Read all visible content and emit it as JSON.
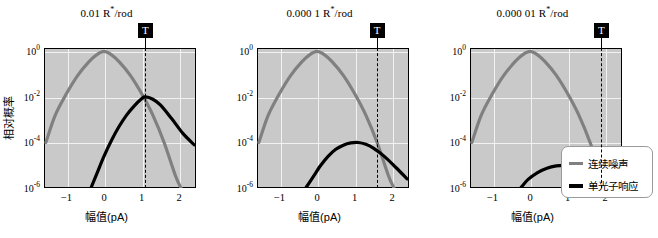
{
  "figure": {
    "y_axis_label": "相对概率",
    "x_axis_label": "幅值(pA)",
    "y_ticks": [
      {
        "mantissa": "10",
        "exp": "0",
        "value": 0
      },
      {
        "mantissa": "10",
        "exp": "-2",
        "value": -2
      },
      {
        "mantissa": "10",
        "exp": "-4",
        "value": -4
      },
      {
        "mantissa": "10",
        "exp": "-6",
        "value": -6
      }
    ],
    "x_ticks": [
      "-1",
      "0",
      "1",
      "2"
    ],
    "threshold_marker": "T",
    "colors": {
      "noise": "#808080",
      "photon": "#000000",
      "plot_background": "#c9c9c9",
      "gridline": "#f2f2f2",
      "axis": "#000000"
    }
  },
  "legend": {
    "position": "right",
    "entries": [
      {
        "label": "连续噪声",
        "color": "#808080"
      },
      {
        "label": "单光子响应",
        "color": "#000000"
      }
    ]
  },
  "chart_data": [
    {
      "type": "line",
      "title": "0.01 R*/rod",
      "title_prefix": "0.01 R",
      "title_suffix": "/rod",
      "xlabel": "幅值(pA)",
      "ylabel": "相对概率",
      "xlim": [
        -1.6,
        2.45
      ],
      "ylim": [
        -6,
        0.15
      ],
      "yscale": "log10",
      "grid": true,
      "threshold": {
        "label": "T",
        "x": 1.1
      },
      "series": [
        {
          "name": "连续噪声",
          "color": "#808080",
          "peak_x": 0.0,
          "peak_log10y": 0.0,
          "points": [
            [
              -1.55,
              -4.0
            ],
            [
              -1.3,
              -2.8
            ],
            [
              -1.0,
              -1.85
            ],
            [
              -0.7,
              -1.05
            ],
            [
              -0.4,
              -0.45
            ],
            [
              -0.2,
              -0.15
            ],
            [
              0.0,
              0.0
            ],
            [
              0.2,
              -0.15
            ],
            [
              0.4,
              -0.45
            ],
            [
              0.7,
              -1.05
            ],
            [
              1.0,
              -1.85
            ],
            [
              1.3,
              -2.8
            ],
            [
              1.6,
              -4.0
            ],
            [
              1.9,
              -5.45
            ],
            [
              2.05,
              -6.0
            ]
          ]
        },
        {
          "name": "单光子响应",
          "color": "#000000",
          "peak_x": 1.1,
          "peak_log10y": -2.0,
          "points": [
            [
              -0.35,
              -6.0
            ],
            [
              -0.2,
              -5.4
            ],
            [
              0.0,
              -4.6
            ],
            [
              0.2,
              -3.9
            ],
            [
              0.4,
              -3.3
            ],
            [
              0.6,
              -2.8
            ],
            [
              0.8,
              -2.4
            ],
            [
              1.0,
              -2.08
            ],
            [
              1.1,
              -2.0
            ],
            [
              1.3,
              -2.1
            ],
            [
              1.5,
              -2.35
            ],
            [
              1.8,
              -2.95
            ],
            [
              2.1,
              -3.6
            ],
            [
              2.4,
              -4.1
            ]
          ]
        }
      ]
    },
    {
      "type": "line",
      "title": "0.000 1 R*/rod",
      "title_prefix": "0.000 1 R",
      "title_suffix": "/rod",
      "xlabel": "幅值(pA)",
      "ylabel": "相对概率",
      "xlim": [
        -1.6,
        2.45
      ],
      "ylim": [
        -6,
        0.15
      ],
      "yscale": "log10",
      "grid": true,
      "threshold": {
        "label": "T",
        "x": 1.6
      },
      "series": [
        {
          "name": "连续噪声",
          "color": "#808080",
          "peak_x": 0.0,
          "peak_log10y": 0.0,
          "points": [
            [
              -1.55,
              -4.0
            ],
            [
              -1.3,
              -2.8
            ],
            [
              -1.0,
              -1.85
            ],
            [
              -0.7,
              -1.05
            ],
            [
              -0.4,
              -0.45
            ],
            [
              -0.2,
              -0.15
            ],
            [
              0.0,
              0.0
            ],
            [
              0.2,
              -0.15
            ],
            [
              0.4,
              -0.45
            ],
            [
              0.7,
              -1.05
            ],
            [
              1.0,
              -1.85
            ],
            [
              1.3,
              -2.8
            ],
            [
              1.6,
              -4.0
            ],
            [
              1.9,
              -5.45
            ],
            [
              2.05,
              -6.0
            ]
          ]
        },
        {
          "name": "单光子响应",
          "color": "#000000",
          "peak_x": 1.1,
          "peak_log10y": -4.0,
          "points": [
            [
              -0.3,
              -6.0
            ],
            [
              -0.1,
              -5.5
            ],
            [
              0.1,
              -5.0
            ],
            [
              0.3,
              -4.6
            ],
            [
              0.5,
              -4.3
            ],
            [
              0.7,
              -4.12
            ],
            [
              0.9,
              -4.02
            ],
            [
              1.1,
              -4.0
            ],
            [
              1.3,
              -4.08
            ],
            [
              1.5,
              -4.25
            ],
            [
              1.8,
              -4.62
            ],
            [
              2.1,
              -5.1
            ],
            [
              2.4,
              -5.6
            ]
          ]
        }
      ]
    },
    {
      "type": "line",
      "title": "0.000 01 R*/rod",
      "title_prefix": "0.000 01 R",
      "title_suffix": "/rod",
      "xlabel": "幅值(pA)",
      "ylabel": "相对概率",
      "xlim": [
        -1.6,
        2.45
      ],
      "ylim": [
        -6,
        0.15
      ],
      "yscale": "log10",
      "grid": true,
      "threshold": {
        "label": "T",
        "x": 1.9
      },
      "series": [
        {
          "name": "连续噪声",
          "color": "#808080",
          "peak_x": 0.0,
          "peak_log10y": 0.0,
          "points": [
            [
              -1.55,
              -4.0
            ],
            [
              -1.3,
              -2.8
            ],
            [
              -1.0,
              -1.85
            ],
            [
              -0.7,
              -1.05
            ],
            [
              -0.4,
              -0.45
            ],
            [
              -0.2,
              -0.15
            ],
            [
              0.0,
              0.0
            ],
            [
              0.2,
              -0.15
            ],
            [
              0.4,
              -0.45
            ],
            [
              0.7,
              -1.05
            ],
            [
              1.0,
              -1.85
            ],
            [
              1.3,
              -2.8
            ],
            [
              1.6,
              -4.0
            ],
            [
              1.9,
              -5.45
            ],
            [
              2.05,
              -6.0
            ]
          ]
        },
        {
          "name": "单光子响应",
          "color": "#000000",
          "peak_x": 1.1,
          "peak_log10y": -5.0,
          "points": [
            [
              -0.25,
              -6.0
            ],
            [
              -0.05,
              -5.62
            ],
            [
              0.2,
              -5.32
            ],
            [
              0.45,
              -5.13
            ],
            [
              0.7,
              -5.03
            ],
            [
              0.95,
              -5.0
            ],
            [
              1.1,
              -5.0
            ],
            [
              1.35,
              -5.08
            ],
            [
              1.6,
              -5.28
            ],
            [
              1.85,
              -5.58
            ],
            [
              2.05,
              -5.9
            ],
            [
              2.15,
              -6.05
            ]
          ]
        }
      ]
    }
  ]
}
